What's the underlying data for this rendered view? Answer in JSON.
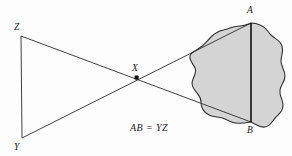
{
  "figure": {
    "kind": "geometry-diagram",
    "background_color": "#fdfdfd",
    "width": 292,
    "height": 156,
    "caption": "AB = YZ",
    "blob_fill_color": "#d4d4d4",
    "blob_stroke_color": "#2f2f2f",
    "line_color": "#2b2b2b",
    "segment_color": "#111111",
    "label_color": "#1a1a1a"
  },
  "labels": {
    "z": "Z",
    "y": "Y",
    "x": "X",
    "a": "A",
    "b": "B",
    "equation": "AB = YZ"
  },
  "points": {
    "Z": {
      "x": 21,
      "y": 36
    },
    "Y": {
      "x": 22,
      "y": 138
    },
    "X": {
      "x": 137,
      "y": 78
    },
    "A": {
      "x": 251,
      "y": 23
    },
    "B": {
      "x": 251,
      "y": 122
    }
  },
  "label_positions": {
    "Z": {
      "x": 14,
      "y": 30
    },
    "Y": {
      "x": 14,
      "y": 150
    },
    "X": {
      "x": 132,
      "y": 71
    },
    "A": {
      "x": 247,
      "y": 13
    },
    "B": {
      "x": 247,
      "y": 133
    },
    "equation": {
      "x": 130,
      "y": 131
    }
  },
  "segments": [
    {
      "name": "ZY",
      "from": "Z",
      "to": "Y",
      "style": "thin"
    },
    {
      "name": "ZB",
      "from": "Z",
      "to": "B",
      "style": "thin"
    },
    {
      "name": "YA",
      "from": "Y",
      "to": "A",
      "style": "thin"
    },
    {
      "name": "AB",
      "from": "A",
      "to": "B",
      "style": "thick"
    }
  ],
  "blob_path": "M 251 23 C 244 27, 238 25, 230 28 C 222 31, 218 30, 212 36 C 206 42, 205 45, 198 49 C 191 53, 188 55, 191 61 C 194 67, 197 68, 195 74 C 193 80, 190 83, 194 89 C 198 95, 201 96, 201 102 C 201 108, 203 112, 209 115 C 215 118, 219 116, 225 119 C 231 122, 235 124, 242 123 C 246 123, 248 122, 251 122 C 256 124, 259 128, 265 127 C 271 126, 272 121, 276 117 C 280 113, 283 111, 283 105 C 283 99, 279 96, 280 90 C 281 84, 285 82, 285 76 C 285 70, 281 67, 281 61 C 281 55, 284 52, 282 46 C 280 40, 275 39, 271 35 C 267 31, 266 27, 260 25 C 256 23, 254 23, 251 23 Z"
}
